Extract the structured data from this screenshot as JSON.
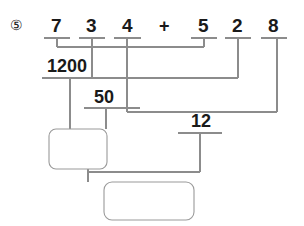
{
  "problem": {
    "number_marker": "⑤",
    "expression_tokens": [
      {
        "text": "7",
        "type": "digit",
        "x": 51,
        "y": 16
      },
      {
        "text": "3",
        "type": "digit",
        "x": 86,
        "y": 16
      },
      {
        "text": "4",
        "type": "digit",
        "x": 122,
        "y": 16
      },
      {
        "text": "+",
        "type": "operator",
        "x": 159,
        "y": 17
      },
      {
        "text": "5",
        "type": "digit",
        "x": 198,
        "y": 16
      },
      {
        "text": "2",
        "type": "digit",
        "x": 232,
        "y": 16
      },
      {
        "text": "8",
        "type": "digit",
        "x": 268,
        "y": 16
      }
    ],
    "intermediate_results": [
      {
        "text": "1200",
        "x": 47,
        "y": 57
      },
      {
        "text": "50",
        "x": 94,
        "y": 88
      },
      {
        "text": "12",
        "x": 191,
        "y": 112
      }
    ],
    "answer_boxes": [
      {
        "name": "answer-box-1",
        "x": 49,
        "y": 129,
        "w": 58,
        "h": 40,
        "value": ""
      },
      {
        "name": "answer-box-2",
        "x": 104,
        "y": 182,
        "w": 90,
        "h": 38,
        "value": ""
      }
    ]
  },
  "colors": {
    "ink": "#1a1a1a",
    "rule": "#8c8c8c",
    "box": "#9a9a9a",
    "background": "#ffffff"
  },
  "geometry": {
    "digit_tick_y": 38,
    "bracket_1200_y": 47,
    "bracket_50_y": 78,
    "bracket_12_y": 112,
    "tick_half_width": 13
  }
}
